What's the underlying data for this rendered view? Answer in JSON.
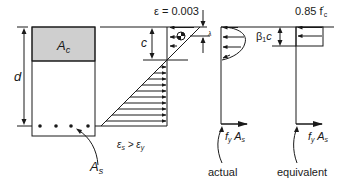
{
  "diagram": {
    "colors": {
      "line": "#1a1a1a",
      "compression_zone": "#cfcfcf",
      "background": "#ffffff"
    },
    "cross_section": {
      "compression_area_label": "A",
      "compression_area_sub": "c",
      "depth_label": "d",
      "steel_area_label": "A",
      "steel_area_sub": "s",
      "bar_count": 4
    },
    "strain_diagram": {
      "top_strain_label": "ε = 0.003",
      "neutral_axis_label": "c",
      "steel_strain_label": "ε",
      "steel_strain_sub": "s",
      "compare": " > ε",
      "yield_sub": "y",
      "lambda_label": "λ"
    },
    "actual_stress": {
      "force_label_f": "f",
      "force_sub_y": "y",
      "force_label_A": " A",
      "force_sub_s": "s",
      "caption": "actual"
    },
    "equivalent_stress": {
      "block_label": "0.85 f",
      "block_sub": "c",
      "block_prime": "′",
      "depth_label": "β",
      "depth_sub": "1",
      "depth_suffix": "c",
      "force_label_f": "f",
      "force_sub_y": "y",
      "force_label_A": " A",
      "force_sub_s": "s",
      "caption": "equivalent"
    }
  }
}
